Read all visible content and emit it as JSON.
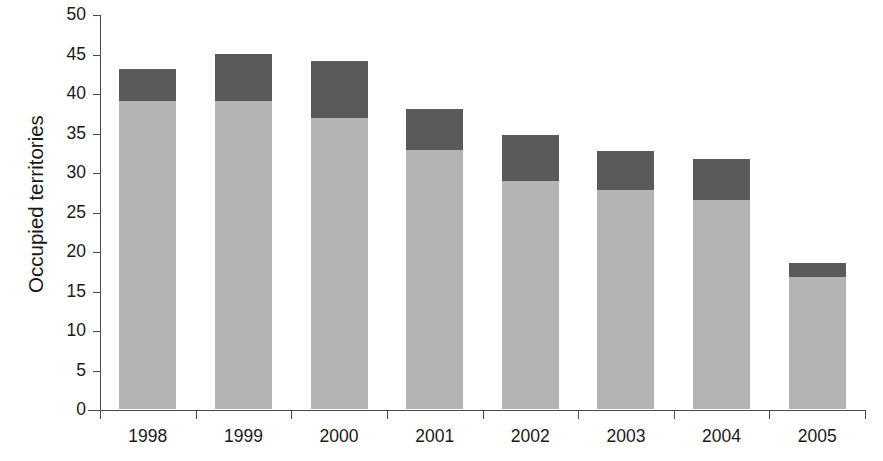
{
  "chart_data": {
    "type": "bar",
    "stacked": true,
    "title": "",
    "xlabel": "",
    "ylabel": "Occupied territories",
    "ylim": [
      0,
      50
    ],
    "yticks": [
      0,
      5,
      10,
      15,
      20,
      25,
      30,
      35,
      40,
      45,
      50
    ],
    "ytick_labels": [
      "0",
      "5",
      "10",
      "15",
      "20",
      "25",
      "30",
      "35",
      "40",
      "45",
      "50"
    ],
    "grid": false,
    "legend": "none",
    "categories": [
      "1998",
      "1999",
      "2000",
      "2001",
      "2002",
      "2003",
      "2004",
      "2005"
    ],
    "series": [
      {
        "name": "lower-segment",
        "color": "#b4b4b4",
        "values": [
          39.0,
          39.0,
          36.8,
          32.8,
          28.8,
          27.7,
          26.4,
          16.7
        ]
      },
      {
        "name": "upper-segment",
        "color": "#5a5a5a",
        "values": [
          4.0,
          6.0,
          7.2,
          5.2,
          5.9,
          4.9,
          5.2,
          1.8
        ]
      }
    ],
    "totals": [
      43.0,
      45.0,
      44.0,
      38.0,
      34.7,
      32.6,
      31.6,
      18.5
    ],
    "colors": {
      "lower": "#b4b4b4",
      "upper": "#5a5a5a",
      "axis": "#4a4a4a",
      "text": "#1a1a1a",
      "background": "#ffffff"
    }
  }
}
